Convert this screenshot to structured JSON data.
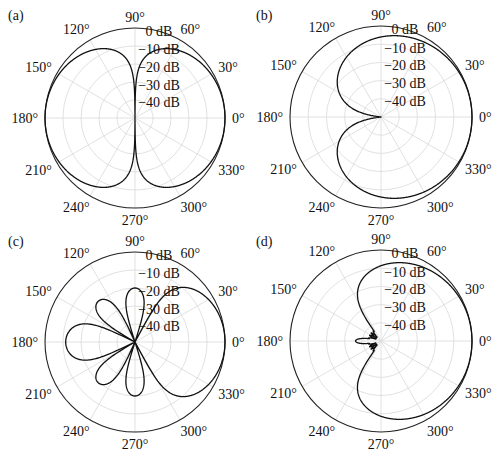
{
  "figure": {
    "panels": [
      {
        "label": "(a)",
        "cx": 135,
        "cy": 118,
        "r": 90,
        "label_x": 8,
        "label_y": 20
      },
      {
        "label": "(b)",
        "cx": 381,
        "cy": 117,
        "r": 91,
        "label_x": 256,
        "label_y": 20
      },
      {
        "label": "(c)",
        "cx": 135,
        "cy": 342,
        "r": 90,
        "label_x": 8,
        "label_y": 246
      },
      {
        "label": "(d)",
        "cx": 381,
        "cy": 341,
        "r": 91,
        "label_x": 256,
        "label_y": 246
      }
    ],
    "angle_labels": [
      "0°",
      "30°",
      "60°",
      "90°",
      "120°",
      "150°",
      "180°",
      "210°",
      "240°",
      "270°",
      "300°",
      "330°"
    ],
    "ring_labels": [
      "0 dB",
      "−10 dB",
      "−20 dB",
      "−30 dB",
      "−40 dB"
    ],
    "colors": {
      "grid": "#d9d9d9",
      "outer": "#222222",
      "curve": "#111111",
      "text": "#111111"
    }
  },
  "chart_data": [
    {
      "type": "polar-line",
      "title": "(a)",
      "description": "Figure-eight (dipole) directivity pattern",
      "radial_unit": "dB",
      "radial_range": [
        -50,
        0
      ],
      "radial_ticks": [
        0,
        -10,
        -20,
        -30,
        -40
      ],
      "angular_ticks_deg": [
        0,
        30,
        60,
        90,
        120,
        150,
        180,
        210,
        240,
        270,
        300,
        330
      ],
      "grid": true,
      "model": "dipole",
      "samples_deg": [
        0,
        30,
        60,
        90,
        120,
        150,
        180,
        210,
        240,
        270,
        300,
        330
      ],
      "samples_db": [
        0,
        -1.2,
        -6.0,
        -50,
        -6.0,
        -1.2,
        0,
        -1.2,
        -6.0,
        -50,
        -6.0,
        -1.2
      ]
    },
    {
      "type": "polar-line",
      "title": "(b)",
      "description": "Cardioid directivity pattern",
      "radial_unit": "dB",
      "radial_range": [
        -50,
        0
      ],
      "radial_ticks": [
        0,
        -10,
        -20,
        -30,
        -40
      ],
      "angular_ticks_deg": [
        0,
        30,
        60,
        90,
        120,
        150,
        180,
        210,
        240,
        270,
        300,
        330
      ],
      "grid": true,
      "model": "cardioid",
      "samples_deg": [
        0,
        30,
        60,
        90,
        120,
        150,
        180,
        210,
        240,
        270,
        300,
        330
      ],
      "samples_db": [
        0,
        -0.6,
        -2.5,
        -6.0,
        -12.0,
        -23.4,
        -50,
        -23.4,
        -12.0,
        -6.0,
        -2.5,
        -0.6
      ]
    },
    {
      "type": "polar-line",
      "title": "(c)",
      "description": "Multi-lobe pattern: main lobe at 0°, back lobe at 180°, side lobes near ±90° and ±130°",
      "radial_unit": "dB",
      "radial_range": [
        -50,
        0
      ],
      "radial_ticks": [
        0,
        -10,
        -20,
        -30,
        -40
      ],
      "angular_ticks_deg": [
        0,
        30,
        60,
        90,
        120,
        150,
        180,
        210,
        240,
        270,
        300,
        330
      ],
      "grid": true,
      "model": "lobes",
      "lobes": [
        {
          "center_deg": 0,
          "peak_db": 0,
          "half_width_deg": 62
        },
        {
          "center_deg": 90,
          "peak_db": -20,
          "half_width_deg": 18
        },
        {
          "center_deg": 132,
          "peak_db": -19.5,
          "half_width_deg": 18
        },
        {
          "center_deg": 180,
          "peak_db": -11.5,
          "half_width_deg": 26
        },
        {
          "center_deg": 228,
          "peak_db": -19.5,
          "half_width_deg": 18
        },
        {
          "center_deg": 270,
          "peak_db": -20,
          "half_width_deg": 18
        }
      ]
    },
    {
      "type": "polar-line",
      "title": "(d)",
      "description": "Highly directional (supercardioid-like) pattern with small back lobe at 180°",
      "radial_unit": "dB",
      "radial_range": [
        -50,
        0
      ],
      "radial_ticks": [
        0,
        -10,
        -20,
        -30,
        -40
      ],
      "angular_ticks_deg": [
        0,
        30,
        60,
        90,
        120,
        150,
        180,
        210,
        240,
        270,
        300,
        330
      ],
      "grid": true,
      "model": "hyper",
      "samples_deg": [
        0,
        30,
        60,
        90,
        120,
        150,
        180,
        210,
        240,
        270,
        300,
        330
      ],
      "samples_db": [
        0,
        -0.8,
        -3.5,
        -17,
        -50,
        -50,
        -38,
        -50,
        -50,
        -17,
        -3.5,
        -0.8
      ]
    }
  ]
}
